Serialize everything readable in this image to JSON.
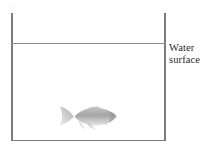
{
  "figure": {
    "background_color": "#ffffff",
    "line_color": "#7c7c7c",
    "text_color": "#2b2b2b"
  },
  "tank": {
    "name": "fish-tank",
    "walls": [
      "left",
      "right",
      "bottom"
    ],
    "open_top": true
  },
  "water": {
    "surface_line_label_line1": "Water",
    "surface_line_label_line2": "surface"
  },
  "fish": {
    "name": "goldfish",
    "facing": "right",
    "color": "#9a9a9a"
  }
}
